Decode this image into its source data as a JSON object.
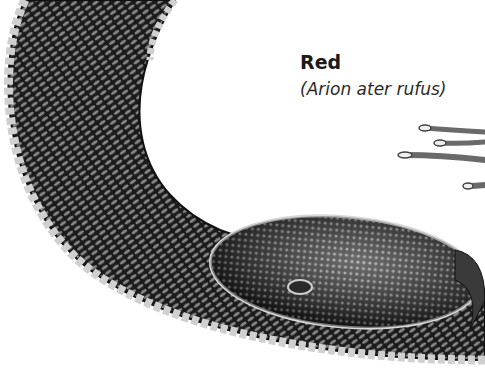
{
  "caption": {
    "title": "Red",
    "subtitle": "(Arion ater rufus)"
  },
  "illustration": {
    "subject": "slug",
    "style": "monochrome engraving",
    "colors": {
      "body_dark": "#141414",
      "body_mid": "#555555",
      "scale_light": "#c8c8c8",
      "foot_fringe": "#d6d6d6",
      "background": "#ffffff"
    }
  }
}
